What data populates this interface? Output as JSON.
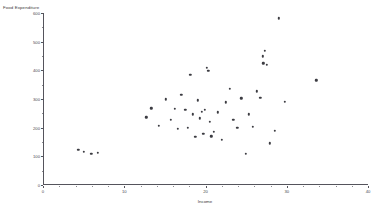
{
  "chart_data": {
    "type": "scatter",
    "title": "",
    "xlabel": "Income",
    "ylabel": "Food Expenditure",
    "xlim": [
      0,
      40
    ],
    "ylim": [
      0,
      600
    ],
    "xticks": [
      0,
      10,
      20,
      30,
      40
    ],
    "yticks": [
      0,
      100,
      200,
      300,
      400,
      500,
      600
    ],
    "xtick_labels": [
      "0",
      "10",
      "20",
      "30",
      "40"
    ],
    "ytick_labels": [
      "0",
      "100",
      "200",
      "300",
      "400",
      "500",
      "600"
    ],
    "grid": false,
    "legend": null,
    "marker": {
      "shape": "circle",
      "color": "#3c3c42",
      "size": 2.4
    },
    "points": [
      {
        "x": 4.2,
        "y": 122
      },
      {
        "x": 4.9,
        "y": 116
      },
      {
        "x": 5.8,
        "y": 108
      },
      {
        "x": 6.6,
        "y": 112
      },
      {
        "x": 12.6,
        "y": 236
      },
      {
        "x": 13.2,
        "y": 268
      },
      {
        "x": 14.1,
        "y": 206
      },
      {
        "x": 15.0,
        "y": 299
      },
      {
        "x": 15.6,
        "y": 227
      },
      {
        "x": 16.1,
        "y": 266
      },
      {
        "x": 16.5,
        "y": 196
      },
      {
        "x": 16.9,
        "y": 314
      },
      {
        "x": 17.4,
        "y": 262
      },
      {
        "x": 17.7,
        "y": 200
      },
      {
        "x": 18.0,
        "y": 384
      },
      {
        "x": 18.3,
        "y": 246
      },
      {
        "x": 18.6,
        "y": 169
      },
      {
        "x": 18.9,
        "y": 295
      },
      {
        "x": 19.2,
        "y": 232
      },
      {
        "x": 19.4,
        "y": 256
      },
      {
        "x": 19.6,
        "y": 178
      },
      {
        "x": 19.8,
        "y": 263
      },
      {
        "x": 20.0,
        "y": 408
      },
      {
        "x": 20.2,
        "y": 398
      },
      {
        "x": 20.4,
        "y": 221
      },
      {
        "x": 20.6,
        "y": 170
      },
      {
        "x": 20.9,
        "y": 186
      },
      {
        "x": 21.4,
        "y": 254
      },
      {
        "x": 21.9,
        "y": 157
      },
      {
        "x": 22.4,
        "y": 289
      },
      {
        "x": 22.9,
        "y": 336
      },
      {
        "x": 23.3,
        "y": 228
      },
      {
        "x": 23.8,
        "y": 200
      },
      {
        "x": 24.3,
        "y": 302
      },
      {
        "x": 24.8,
        "y": 108
      },
      {
        "x": 25.2,
        "y": 247
      },
      {
        "x": 25.7,
        "y": 204
      },
      {
        "x": 26.2,
        "y": 327
      },
      {
        "x": 26.6,
        "y": 304
      },
      {
        "x": 26.9,
        "y": 449
      },
      {
        "x": 27.0,
        "y": 425
      },
      {
        "x": 27.2,
        "y": 468
      },
      {
        "x": 27.4,
        "y": 419
      },
      {
        "x": 27.8,
        "y": 145
      },
      {
        "x": 28.4,
        "y": 189
      },
      {
        "x": 28.9,
        "y": 582
      },
      {
        "x": 29.6,
        "y": 291
      },
      {
        "x": 33.5,
        "y": 365
      }
    ]
  }
}
